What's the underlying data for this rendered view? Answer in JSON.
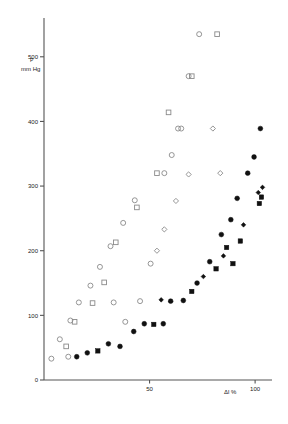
{
  "chart_data": {
    "type": "scatter",
    "title": "",
    "xlabel": "Δl %",
    "ylabel_line1": "P",
    "ylabel_line2": "mm Hg",
    "xlim": [
      0,
      108
    ],
    "ylim": [
      0,
      560
    ],
    "grid": false,
    "legend_position": "none",
    "xticks": [
      {
        "value": 50,
        "label": "50"
      },
      {
        "value": 100,
        "label": "100"
      }
    ],
    "yticks": [
      {
        "value": 0,
        "label": "0"
      },
      {
        "value": 100,
        "label": "100"
      },
      {
        "value": 200,
        "label": "200"
      },
      {
        "value": 300,
        "label": "300"
      },
      {
        "value": 400,
        "label": "400"
      },
      {
        "value": 500,
        "label": "500"
      }
    ],
    "series": [
      {
        "name": "open-circle",
        "marker": "circle",
        "fill": "open",
        "color": "#8a8a8a",
        "points": [
          [
            3.5,
            33
          ],
          [
            7.5,
            63
          ],
          [
            11.5,
            36
          ],
          [
            12.5,
            92
          ],
          [
            16.5,
            120
          ],
          [
            22.0,
            146
          ],
          [
            26.5,
            175
          ],
          [
            31.5,
            207
          ],
          [
            37.5,
            243
          ],
          [
            43.0,
            278
          ],
          [
            45.5,
            122
          ],
          [
            50.5,
            180
          ],
          [
            57.0,
            320
          ],
          [
            60.5,
            348
          ],
          [
            65.0,
            389
          ],
          [
            68.5,
            470
          ],
          [
            73.5,
            535
          ],
          [
            63.5,
            389
          ],
          [
            38.5,
            90
          ],
          [
            33.0,
            120
          ]
        ]
      },
      {
        "name": "open-square",
        "marker": "square",
        "fill": "open",
        "color": "#8a8a8a",
        "points": [
          [
            10.5,
            52
          ],
          [
            14.5,
            90
          ],
          [
            23.0,
            119
          ],
          [
            28.5,
            151
          ],
          [
            34.0,
            213
          ],
          [
            44.0,
            267
          ],
          [
            53.5,
            320
          ],
          [
            59.0,
            414
          ],
          [
            70.0,
            470
          ],
          [
            82.0,
            535
          ]
        ]
      },
      {
        "name": "open-diamond",
        "marker": "diamond",
        "fill": "open",
        "color": "#8a8a8a",
        "points": [
          [
            53.5,
            200
          ],
          [
            57.0,
            233
          ],
          [
            62.5,
            277
          ],
          [
            68.5,
            318
          ],
          [
            80.0,
            389
          ],
          [
            83.5,
            320
          ]
        ]
      },
      {
        "name": "filled-circle",
        "marker": "circle",
        "fill": "solid",
        "color": "#111111",
        "points": [
          [
            15.5,
            36
          ],
          [
            20.5,
            42
          ],
          [
            30.5,
            56
          ],
          [
            36.0,
            52
          ],
          [
            42.5,
            75
          ],
          [
            47.5,
            87
          ],
          [
            56.5,
            87
          ],
          [
            60.0,
            122
          ],
          [
            66.0,
            123
          ],
          [
            72.5,
            150
          ],
          [
            78.5,
            183
          ],
          [
            84.0,
            225
          ],
          [
            88.5,
            248
          ],
          [
            91.5,
            281
          ],
          [
            96.5,
            320
          ],
          [
            99.5,
            345
          ],
          [
            102.5,
            389
          ]
        ]
      },
      {
        "name": "filled-square",
        "marker": "square",
        "fill": "solid",
        "color": "#111111",
        "points": [
          [
            25.5,
            45
          ],
          [
            52.0,
            86
          ],
          [
            70.0,
            137
          ],
          [
            81.5,
            172
          ],
          [
            86.5,
            205
          ],
          [
            93.0,
            215
          ],
          [
            89.5,
            180
          ],
          [
            102.0,
            273
          ],
          [
            103.0,
            283
          ]
        ]
      },
      {
        "name": "filled-diamond",
        "marker": "diamond",
        "fill": "solid",
        "color": "#111111",
        "points": [
          [
            55.5,
            124
          ],
          [
            75.5,
            160
          ],
          [
            85.0,
            192
          ],
          [
            94.5,
            240
          ],
          [
            101.5,
            290
          ],
          [
            103.5,
            298
          ]
        ]
      }
    ]
  }
}
